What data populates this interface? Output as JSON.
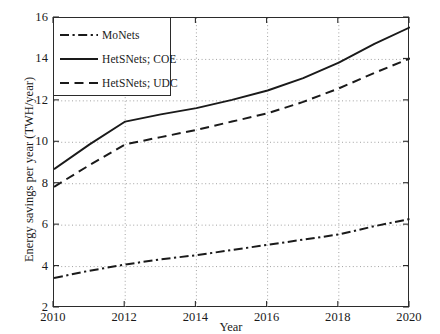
{
  "chart_data": {
    "type": "line",
    "title": "",
    "xlabel": "Year",
    "ylabel": "Energy savings per year (TWH/year)",
    "xlim": [
      2010,
      2020
    ],
    "ylim": [
      2,
      16
    ],
    "xticks": [
      2010,
      2012,
      2014,
      2016,
      2018,
      2020
    ],
    "yticks": [
      2,
      4,
      6,
      8,
      10,
      12,
      14,
      16
    ],
    "grid": true,
    "grid_style": "dotted",
    "legend_position": "upper left",
    "x": [
      2010,
      2011,
      2012,
      2013,
      2014,
      2015,
      2016,
      2017,
      2018,
      2019,
      2020
    ],
    "series": [
      {
        "name": "MoNets",
        "style": "dash-dot",
        "color": "#1a1a1a",
        "values": [
          3.45,
          3.8,
          4.1,
          4.35,
          4.55,
          4.8,
          5.05,
          5.3,
          5.55,
          5.95,
          6.3
        ]
      },
      {
        "name": "HetSNets; COE",
        "style": "solid",
        "color": "#1a1a1a",
        "values": [
          8.7,
          9.9,
          11.0,
          11.35,
          11.65,
          12.05,
          12.5,
          13.1,
          13.85,
          14.75,
          15.55
        ]
      },
      {
        "name": "HetSNets; UDC",
        "style": "dashed",
        "color": "#1a1a1a",
        "values": [
          7.85,
          8.9,
          9.9,
          10.25,
          10.6,
          11.0,
          11.4,
          11.95,
          12.6,
          13.35,
          14.05
        ]
      }
    ]
  },
  "legend": {
    "items": [
      {
        "label": "MoNets",
        "sample": "dash-dot-sample"
      },
      {
        "label": "HetSNets; COE",
        "sample": "solid-sample"
      },
      {
        "label": "HetSNets; UDC",
        "sample": "dashed-sample"
      }
    ]
  }
}
